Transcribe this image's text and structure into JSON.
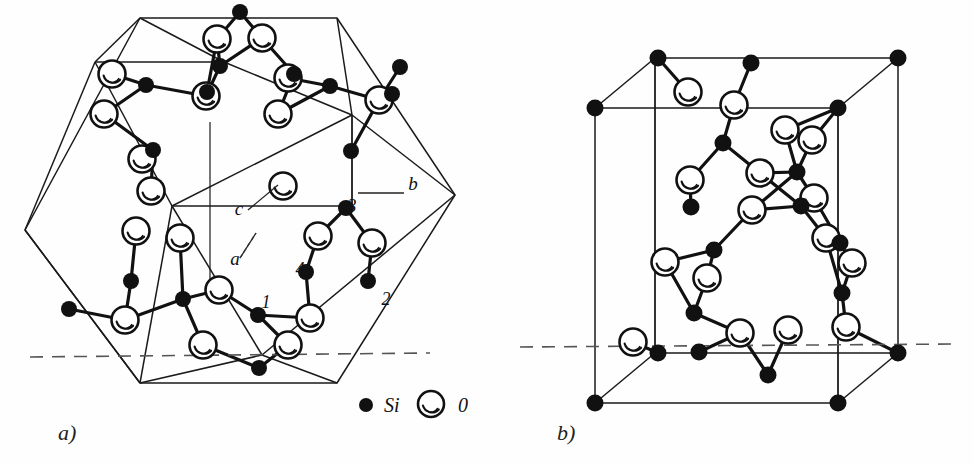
{
  "figure": {
    "kind": "crystal-structure-diagram",
    "background": "#ffffff",
    "ink": "#111111",
    "panels": [
      {
        "id": "a",
        "label": "a)",
        "cell": "hexagonal prism",
        "x": 58,
        "y": 440
      },
      {
        "id": "b",
        "label": "b)",
        "cell": "tetragonal prism",
        "x": 557,
        "y": 440
      }
    ]
  },
  "legend": {
    "items": [
      {
        "key": "si",
        "symbol_type": "filled-circle",
        "label": "Si",
        "color": "#111111",
        "cx": 366,
        "cy": 405,
        "r": 7,
        "tx": 384,
        "ty": 412
      },
      {
        "key": "o",
        "symbol_type": "open-circle",
        "label": "0",
        "color": "#ffffff",
        "cx": 431,
        "cy": 404,
        "r": 13,
        "tx": 458,
        "ty": 412
      }
    ]
  },
  "axis_labels": [
    {
      "name": "b",
      "text": "b",
      "x": 413,
      "y": 190,
      "leader": [
        [
          404,
          193
        ],
        [
          358,
          193
        ]
      ]
    },
    {
      "name": "c",
      "text": "c",
      "x": 239,
      "y": 215,
      "leader": [
        [
          248,
          210
        ],
        [
          278,
          185
        ]
      ]
    },
    {
      "name": "a",
      "text": "a",
      "x": 235,
      "y": 265,
      "leader": [
        [
          240,
          258
        ],
        [
          256,
          233
        ]
      ]
    }
  ],
  "site_numbers": [
    {
      "name": "1",
      "text": "1",
      "x": 266,
      "y": 308
    },
    {
      "name": "2",
      "text": "2",
      "x": 386,
      "y": 305
    },
    {
      "name": "3",
      "text": "3",
      "x": 352,
      "y": 212
    },
    {
      "name": "4",
      "text": "4",
      "x": 300,
      "y": 275
    }
  ],
  "chart_data": {
    "type": "diagram",
    "title": "",
    "panel_a": {
      "outline_hex": [
        [
          140,
          18
        ],
        [
          337,
          18
        ],
        [
          455,
          195
        ],
        [
          337,
          383
        ],
        [
          140,
          383
        ],
        [
          25,
          230
        ]
      ],
      "inner_quad_top": [
        [
          95,
          62
        ],
        [
          224,
          62
        ],
        [
          375,
          110
        ],
        [
          248,
          110
        ]
      ],
      "dashed_y": 357,
      "si_atoms": [
        [
          240,
          12
        ],
        [
          220,
          66
        ],
        [
          294,
          74
        ],
        [
          400,
          67
        ],
        [
          146,
          85
        ],
        [
          330,
          86
        ],
        [
          392,
          94
        ],
        [
          207,
          92
        ],
        [
          153,
          150
        ],
        [
          351,
          151
        ],
        [
          346,
          208
        ],
        [
          306,
          272
        ],
        [
          368,
          281
        ],
        [
          131,
          281
        ],
        [
          69,
          309
        ],
        [
          183,
          299
        ],
        [
          258,
          315
        ],
        [
          259,
          368
        ]
      ],
      "o_atoms": [
        [
          217,
          39
        ],
        [
          262,
          38
        ],
        [
          112,
          74
        ],
        [
          206,
          96
        ],
        [
          288,
          78
        ],
        [
          379,
          100
        ],
        [
          104,
          114
        ],
        [
          142,
          159
        ],
        [
          278,
          114
        ],
        [
          283,
          186
        ],
        [
          151,
          191
        ],
        [
          136,
          231
        ],
        [
          180,
          238
        ],
        [
          318,
          236
        ],
        [
          372,
          243
        ],
        [
          219,
          290
        ],
        [
          310,
          318
        ],
        [
          125,
          320
        ],
        [
          203,
          345
        ],
        [
          288,
          345
        ]
      ]
    },
    "panel_b": {
      "outline_box_front": [
        [
          595,
          108
        ],
        [
          838,
          108
        ],
        [
          838,
          403
        ],
        [
          595,
          403
        ]
      ],
      "outline_box_back": [
        [
          655,
          58
        ],
        [
          898,
          58
        ],
        [
          898,
          353
        ],
        [
          655,
          353
        ]
      ],
      "dashed_y": 347,
      "si_atoms": [
        [
          658,
          58
        ],
        [
          898,
          58
        ],
        [
          595,
          108
        ],
        [
          838,
          108
        ],
        [
          658,
          353
        ],
        [
          898,
          353
        ],
        [
          595,
          403
        ],
        [
          838,
          403
        ],
        [
          751,
          63
        ],
        [
          723,
          143
        ],
        [
          797,
          172
        ],
        [
          691,
          207
        ],
        [
          801,
          206
        ],
        [
          714,
          250
        ],
        [
          840,
          243
        ],
        [
          694,
          313
        ],
        [
          842,
          293
        ],
        [
          768,
          375
        ],
        [
          699,
          352
        ]
      ],
      "o_atoms": [
        [
          688,
          92
        ],
        [
          734,
          105
        ],
        [
          785,
          130
        ],
        [
          812,
          140
        ],
        [
          690,
          180
        ],
        [
          760,
          173
        ],
        [
          752,
          210
        ],
        [
          665,
          262
        ],
        [
          707,
          278
        ],
        [
          814,
          198
        ],
        [
          826,
          238
        ],
        [
          852,
          263
        ],
        [
          740,
          333
        ],
        [
          788,
          330
        ],
        [
          846,
          327
        ],
        [
          633,
          342
        ]
      ]
    }
  }
}
